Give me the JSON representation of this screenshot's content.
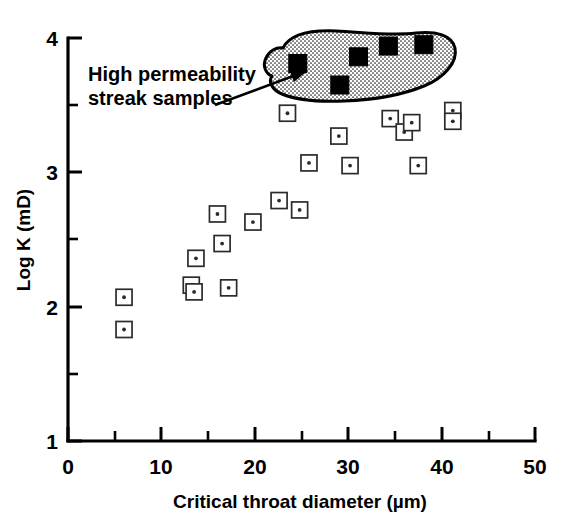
{
  "chart_data": {
    "type": "scatter",
    "title": "",
    "xlabel": "Critical throat diameter (µm)",
    "ylabel": "Log K (mD)",
    "xlim": [
      0,
      50
    ],
    "ylim": [
      1,
      4
    ],
    "xticks": [
      0,
      10,
      20,
      30,
      40,
      50
    ],
    "xtick_labels": [
      "0",
      "10",
      "20",
      "30",
      "40",
      "50"
    ],
    "x_minor_ticks": [
      5,
      15,
      25,
      35,
      45
    ],
    "yticks": [
      1,
      2,
      3,
      4
    ],
    "ytick_labels": [
      "1",
      "2",
      "3",
      "4"
    ],
    "y_minor_ticks": [
      1.5,
      2.5,
      3.5
    ],
    "grid": false,
    "legend": "none",
    "series": [
      {
        "name": "Standard samples",
        "marker": "open-square-with-dot",
        "points": [
          [
            6.0,
            2.07
          ],
          [
            6.0,
            1.83
          ],
          [
            13.2,
            2.16
          ],
          [
            13.7,
            2.36
          ],
          [
            13.5,
            2.11
          ],
          [
            16.0,
            2.69
          ],
          [
            16.5,
            2.47
          ],
          [
            17.2,
            2.14
          ],
          [
            19.8,
            2.63
          ],
          [
            22.6,
            2.79
          ],
          [
            24.8,
            2.72
          ],
          [
            23.5,
            3.44
          ],
          [
            25.8,
            3.07
          ],
          [
            29.0,
            3.27
          ],
          [
            30.2,
            3.05
          ],
          [
            34.5,
            3.4
          ],
          [
            36.0,
            3.3
          ],
          [
            36.8,
            3.37
          ],
          [
            37.5,
            3.05
          ],
          [
            41.2,
            3.46
          ],
          [
            41.2,
            3.38
          ]
        ]
      },
      {
        "name": "High permeability streak samples",
        "marker": "filled-square",
        "points": [
          [
            24.6,
            3.81
          ],
          [
            29.1,
            3.65
          ],
          [
            31.1,
            3.86
          ],
          [
            34.3,
            3.94
          ],
          [
            38.1,
            3.95
          ]
        ]
      }
    ],
    "annotations": [
      {
        "text_lines": [
          "High permeability",
          "streak samples"
        ],
        "kind": "callout-with-arrow",
        "points_to_group": "High permeability streak samples"
      }
    ],
    "enclosure": {
      "kind": "stippled-outline-region",
      "encloses_group": "High permeability streak samples"
    }
  },
  "annotation": {
    "line1": "High permeability",
    "line2": "streak samples"
  },
  "axes": {
    "x_title": "Critical throat diameter (µm)",
    "y_title": "Log K (mD)",
    "x_labels": [
      "0",
      "10",
      "20",
      "30",
      "40",
      "50"
    ],
    "y_labels": [
      "1",
      "2",
      "3",
      "4"
    ]
  },
  "colors": {
    "ink": "#000000",
    "marker_stroke": "#2b2b2b",
    "background": "#ffffff"
  }
}
